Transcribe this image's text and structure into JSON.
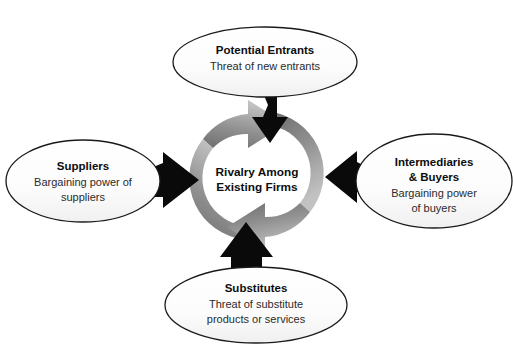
{
  "diagram": {
    "background_color": "#ffffff",
    "center": {
      "label_line1": "Rivalry Among",
      "label_line2": "Existing Firms"
    },
    "forces": [
      {
        "id": "potential-entrants",
        "position": "top",
        "title": "Potential Entrants",
        "subtitle_lines": [
          "Threat of new entrants"
        ]
      },
      {
        "id": "suppliers",
        "position": "left",
        "title": "Suppliers",
        "subtitle_lines": [
          "Bargaining power of",
          "suppliers"
        ]
      },
      {
        "id": "intermediaries-buyers",
        "position": "right",
        "title_lines": [
          "Intermediaries",
          "& Buyers"
        ],
        "subtitle_lines": [
          "Bargaining power",
          "of buyers"
        ]
      },
      {
        "id": "substitutes",
        "position": "bottom",
        "title": "Substitutes",
        "subtitle_lines": [
          "Threat of substitute",
          "products or services"
        ]
      }
    ],
    "colors": {
      "arrow_black": "#0a0a0a",
      "arrow_gray_light": "#b8b8b8",
      "arrow_gray_dark": "#6e6e6e",
      "ellipse_fill": "#fbfbfb",
      "ellipse_stroke": "#1a1a1a",
      "text_primary": "#0d0d0d",
      "text_secondary": "#2b2b2b"
    },
    "cycle_arrows": [
      {
        "id": "cycle-arrow-left",
        "direction": "clockwise",
        "head": "top"
      },
      {
        "id": "cycle-arrow-right",
        "direction": "clockwise",
        "head": "bottom"
      }
    ],
    "inward_arrows": [
      "top",
      "right",
      "bottom",
      "left"
    ]
  }
}
